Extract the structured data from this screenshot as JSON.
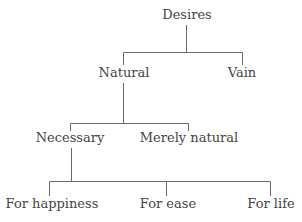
{
  "diagram": {
    "type": "tree",
    "line_color": "#6a6a6a",
    "text_color": "#444444",
    "nodes": {
      "root": {
        "label": "Desires"
      },
      "natural": {
        "label": "Natural"
      },
      "vain": {
        "label": "Vain"
      },
      "necessary": {
        "label": "Necessary"
      },
      "merely_natural": {
        "label": "Merely natural"
      },
      "for_happiness": {
        "label": "For happiness"
      },
      "for_ease": {
        "label": "For ease"
      },
      "for_life": {
        "label": "For life"
      }
    },
    "edges": [
      [
        "Desires",
        "Natural"
      ],
      [
        "Desires",
        "Vain"
      ],
      [
        "Natural",
        "Necessary"
      ],
      [
        "Natural",
        "Merely natural"
      ],
      [
        "Necessary",
        "For happiness"
      ],
      [
        "Necessary",
        "For ease"
      ],
      [
        "Necessary",
        "For life"
      ]
    ]
  }
}
